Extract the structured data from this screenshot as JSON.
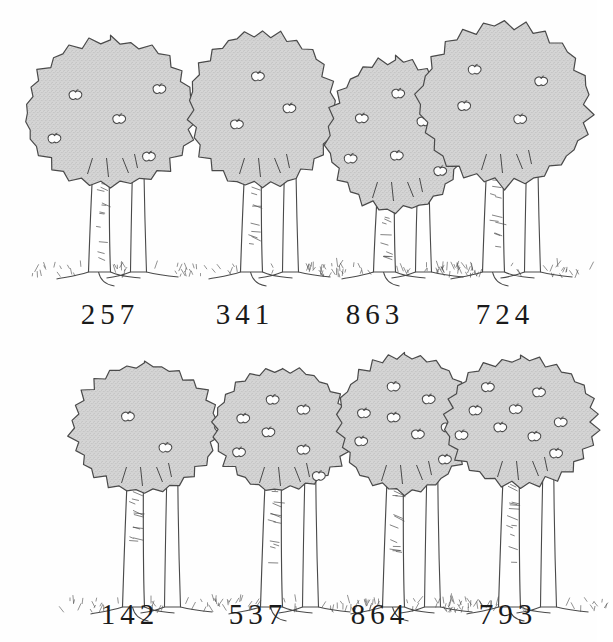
{
  "figure": {
    "background_color": "#fefefe",
    "foliage_fill": "#d6d6d6",
    "foliage_stipple": "#bdbdbd",
    "ink_color": "#4a4a4a",
    "label_color": "#1a1a1a",
    "apple_fill": "#fdfdfd",
    "rows": 2,
    "columns": 4
  },
  "rows": [
    {
      "name": "top-row",
      "trees": [
        {
          "label": "257",
          "apple_count": 5,
          "crown_width": 175,
          "crown_height": 150,
          "crown_top": 38,
          "left": 18,
          "label_left": 50,
          "label_width": 120,
          "apples": [
            {
              "x": 0.3,
              "y": 0.37
            },
            {
              "x": 0.55,
              "y": 0.53
            },
            {
              "x": 0.78,
              "y": 0.33
            },
            {
              "x": 0.18,
              "y": 0.66
            },
            {
              "x": 0.72,
              "y": 0.78
            }
          ]
        },
        {
          "label": "341",
          "apple_count": 3,
          "crown_width": 150,
          "crown_height": 160,
          "crown_top": 30,
          "left": 170,
          "label_left": 185,
          "label_width": 120,
          "apples": [
            {
              "x": 0.47,
              "y": 0.28
            },
            {
              "x": 0.68,
              "y": 0.48
            },
            {
              "x": 0.33,
              "y": 0.58
            }
          ]
        },
        {
          "label": "863",
          "apple_count": 6,
          "crown_width": 140,
          "crown_height": 155,
          "crown_top": 58,
          "left": 303,
          "label_left": 315,
          "label_width": 120,
          "apples": [
            {
              "x": 0.52,
              "y": 0.22
            },
            {
              "x": 0.26,
              "y": 0.38
            },
            {
              "x": 0.7,
              "y": 0.4
            },
            {
              "x": 0.18,
              "y": 0.64
            },
            {
              "x": 0.51,
              "y": 0.62
            },
            {
              "x": 0.82,
              "y": 0.72
            }
          ]
        },
        {
          "label": "724",
          "apple_count": 4,
          "crown_width": 175,
          "crown_height": 165,
          "crown_top": 22,
          "left": 412,
          "label_left": 445,
          "label_width": 120,
          "apples": [
            {
              "x": 0.33,
              "y": 0.28
            },
            {
              "x": 0.71,
              "y": 0.35
            },
            {
              "x": 0.27,
              "y": 0.5
            },
            {
              "x": 0.59,
              "y": 0.58
            }
          ]
        }
      ]
    },
    {
      "name": "bottom-row",
      "trees": [
        {
          "label": "142",
          "apple_count": 2,
          "crown_width": 150,
          "crown_height": 130,
          "crown_top": 28,
          "left": 52,
          "label_left": 70,
          "label_width": 120,
          "apples": [
            {
              "x": 0.39,
              "y": 0.4
            },
            {
              "x": 0.64,
              "y": 0.64
            }
          ]
        },
        {
          "label": "537",
          "apple_count": 7,
          "crown_width": 140,
          "crown_height": 125,
          "crown_top": 32,
          "left": 190,
          "label_left": 198,
          "label_width": 120,
          "apples": [
            {
              "x": 0.43,
              "y": 0.25
            },
            {
              "x": 0.65,
              "y": 0.33
            },
            {
              "x": 0.22,
              "y": 0.4
            },
            {
              "x": 0.4,
              "y": 0.51
            },
            {
              "x": 0.19,
              "y": 0.67
            },
            {
              "x": 0.65,
              "y": 0.65
            },
            {
              "x": 0.76,
              "y": 0.86
            }
          ]
        },
        {
          "label": "864",
          "apple_count": 8,
          "crown_width": 135,
          "crown_height": 140,
          "crown_top": 18,
          "left": 312,
          "label_left": 320,
          "label_width": 120,
          "apples": [
            {
              "x": 0.42,
              "y": 0.23
            },
            {
              "x": 0.68,
              "y": 0.32
            },
            {
              "x": 0.2,
              "y": 0.42
            },
            {
              "x": 0.42,
              "y": 0.45
            },
            {
              "x": 0.82,
              "y": 0.52
            },
            {
              "x": 0.6,
              "y": 0.57
            },
            {
              "x": 0.18,
              "y": 0.62
            },
            {
              "x": 0.8,
              "y": 0.75
            }
          ]
        },
        {
          "label": "793",
          "apple_count": 9,
          "crown_width": 155,
          "crown_height": 130,
          "crown_top": 22,
          "left": 428,
          "label_left": 448,
          "label_width": 120,
          "apples": [
            {
              "x": 0.29,
              "y": 0.22
            },
            {
              "x": 0.62,
              "y": 0.26
            },
            {
              "x": 0.21,
              "y": 0.4
            },
            {
              "x": 0.47,
              "y": 0.39
            },
            {
              "x": 0.76,
              "y": 0.49
            },
            {
              "x": 0.12,
              "y": 0.59
            },
            {
              "x": 0.37,
              "y": 0.53
            },
            {
              "x": 0.59,
              "y": 0.6
            },
            {
              "x": 0.73,
              "y": 0.73
            }
          ]
        }
      ]
    }
  ]
}
